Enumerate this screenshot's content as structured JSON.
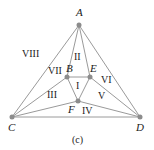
{
  "diagram": {
    "caption": "(c)",
    "vertices": [
      {
        "id": "A",
        "label": "A",
        "x": 79,
        "y": 25,
        "lx": 76,
        "ly": 16
      },
      {
        "id": "B",
        "label": "B",
        "x": 67,
        "y": 77,
        "lx": 66,
        "ly": 72
      },
      {
        "id": "C",
        "label": "C",
        "x": 12,
        "y": 117,
        "lx": 8,
        "ly": 131
      },
      {
        "id": "D",
        "label": "D",
        "x": 140,
        "y": 117,
        "lx": 136,
        "ly": 131
      },
      {
        "id": "E",
        "label": "E",
        "x": 90,
        "y": 77,
        "lx": 90,
        "ly": 72
      },
      {
        "id": "F",
        "label": "F",
        "x": 78,
        "y": 101,
        "lx": 68,
        "ly": 113
      }
    ],
    "edges": [
      [
        "A",
        "C"
      ],
      [
        "A",
        "D"
      ],
      [
        "C",
        "D"
      ],
      [
        "A",
        "B"
      ],
      [
        "A",
        "E"
      ],
      [
        "B",
        "E"
      ],
      [
        "B",
        "F"
      ],
      [
        "E",
        "F"
      ],
      [
        "B",
        "C"
      ],
      [
        "C",
        "F"
      ],
      [
        "F",
        "D"
      ],
      [
        "E",
        "D"
      ]
    ],
    "regions": [
      {
        "label": "I",
        "x": 76,
        "y": 89
      },
      {
        "label": "II",
        "x": 74,
        "y": 60
      },
      {
        "label": "III",
        "x": 47,
        "y": 98
      },
      {
        "label": "IV",
        "x": 82,
        "y": 114
      },
      {
        "label": "V",
        "x": 98,
        "y": 99
      },
      {
        "label": "VI",
        "x": 101,
        "y": 83
      },
      {
        "label": "VII",
        "x": 48,
        "y": 74
      },
      {
        "label": "VIII",
        "x": 22,
        "y": 57
      }
    ]
  }
}
